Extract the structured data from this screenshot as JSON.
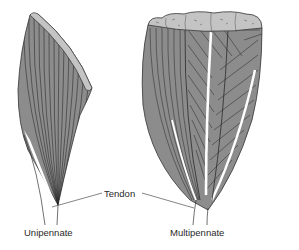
{
  "figure": {
    "labels": {
      "unipennate": "Unipennate",
      "multipennate": "Multipennate",
      "tendon": "Tendon"
    },
    "colors": {
      "muscle_fill": "#8c8c8c",
      "fiber_line": "#2e2e2e",
      "cut_surface": "#c4c4c4",
      "tendon": "#ffffff",
      "outline": "#333333"
    }
  }
}
